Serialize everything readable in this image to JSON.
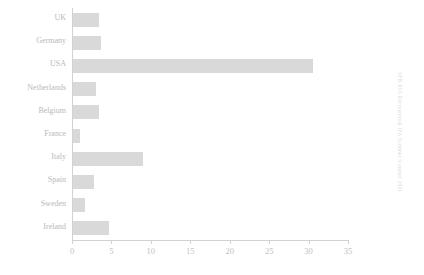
{
  "chart_data": {
    "type": "bar",
    "orientation": "horizontal",
    "title": "",
    "subtitle": "",
    "xlabel": "",
    "ylabel": "",
    "categories": [
      "UK",
      "Germany",
      "USA",
      "Netherlands",
      "Belgium",
      "France",
      "Italy",
      "Spain",
      "Sweden",
      "Ireland"
    ],
    "values": [
      3.4,
      3.7,
      30.6,
      3.0,
      3.4,
      1.0,
      9.0,
      2.8,
      1.7,
      4.7
    ],
    "xlim": [
      0,
      35
    ],
    "xticks": [
      0,
      5,
      10,
      15,
      20,
      25,
      30,
      35
    ],
    "xtick_labels": [
      "0",
      "5",
      "10",
      "15",
      "20",
      "25",
      "30",
      "35"
    ],
    "grid": false,
    "legend": false,
    "legend_position": "none",
    "bar_color": "#d9d9d9",
    "axis_color": "#d2d2d2",
    "label_color": "#b9b9b9"
  },
  "side_caption": {
    "text": "SFB RUI Recreational IFA Summer Summer 2001"
  }
}
